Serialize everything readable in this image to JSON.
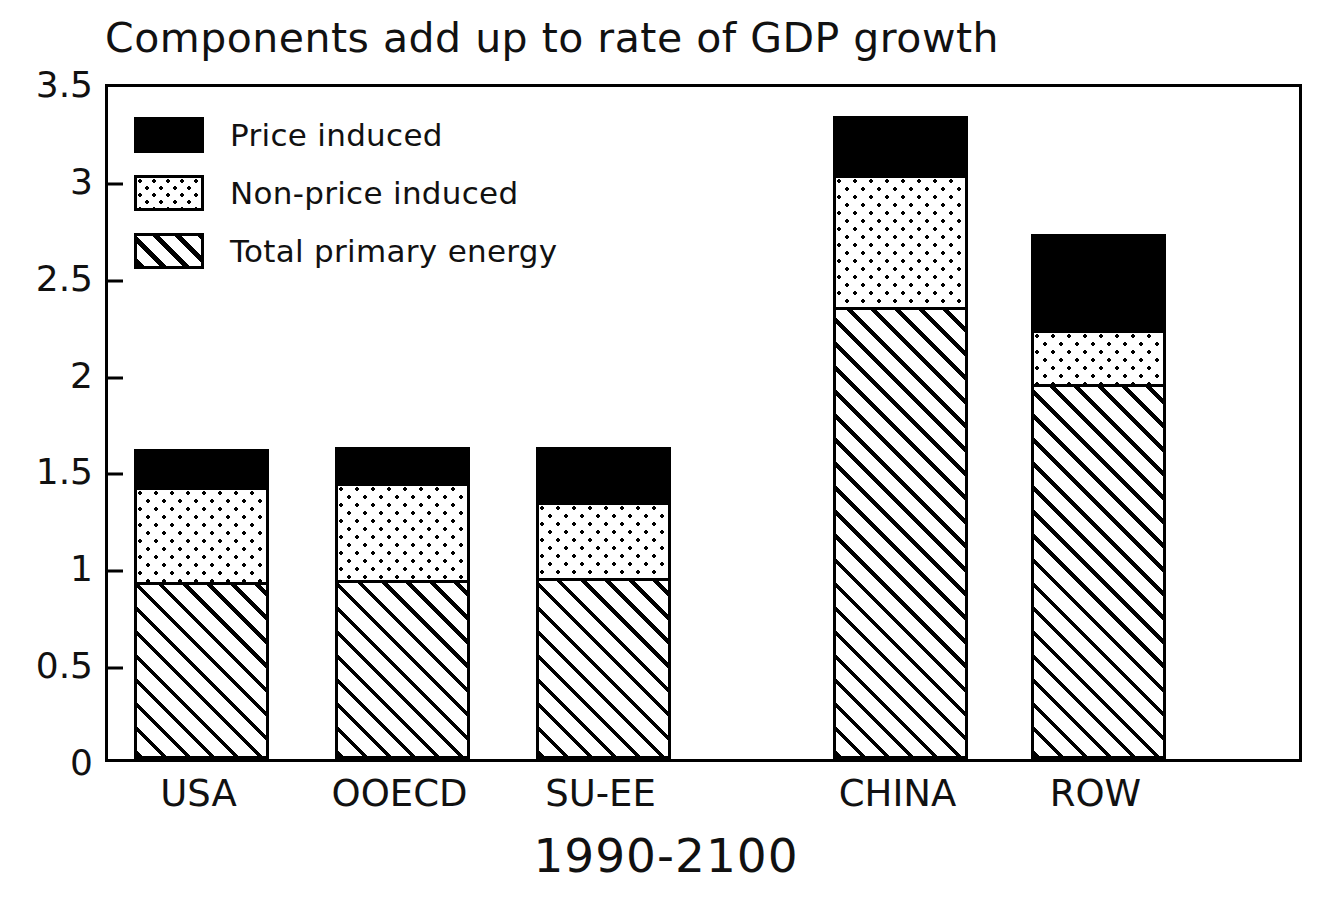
{
  "chart_data": {
    "type": "bar",
    "subtype": "stacked-bar",
    "title": "Components add up to rate of GDP growth",
    "xlabel": "1990-2100",
    "ylabel": "",
    "categories": [
      "USA",
      "OOECD",
      "SU-EE",
      "CHINA",
      "ROW"
    ],
    "series": [
      {
        "name": "Total primary energy",
        "pattern": "diagonal-hatch",
        "values": [
          0.9,
          0.91,
          0.92,
          2.32,
          1.92
        ]
      },
      {
        "name": "Non-price induced",
        "pattern": "dotted",
        "values": [
          0.49,
          0.5,
          0.39,
          0.68,
          0.28
        ]
      },
      {
        "name": "Price induced",
        "pattern": "solid-black",
        "values": [
          0.21,
          0.2,
          0.3,
          0.32,
          0.51
        ]
      }
    ],
    "stack_totals": [
      1.6,
      1.61,
      1.61,
      3.32,
      2.71
    ],
    "ylim": [
      0,
      3.5
    ],
    "yticks": [
      0,
      0.5,
      1,
      1.5,
      2,
      2.5,
      3,
      3.5
    ],
    "ytick_labels": [
      "0",
      "0.5",
      "1",
      "1.5",
      "2",
      "2.5",
      "3",
      "3.5"
    ],
    "grid": false,
    "legend_position": "top-left-inside",
    "colors": {
      "price_induced": "#000000",
      "non_price_induced": "#ffffff",
      "total_primary_energy": "#ffffff",
      "line": "#000000",
      "background": "#ffffff"
    }
  },
  "legend": {
    "items": [
      {
        "label": "Price induced",
        "swatch": "solid-black-swatch"
      },
      {
        "label": "Non-price induced",
        "swatch": "dotted-swatch"
      },
      {
        "label": "Total primary energy",
        "swatch": "hatch-swatch"
      }
    ]
  }
}
